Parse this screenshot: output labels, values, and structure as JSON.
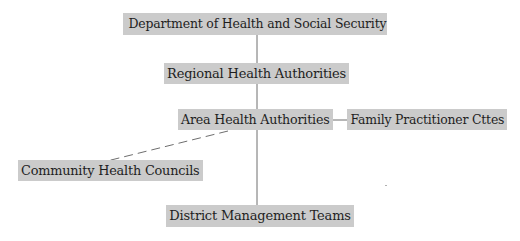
{
  "diagram": {
    "type": "org-chart",
    "colors": {
      "node_fill": "#cbcbcb",
      "text": "#1e1e1e",
      "line": "#6e6e6e",
      "background": "#ffffff"
    },
    "nodes": [
      {
        "id": "dhss",
        "label": "Department of Health and Social Security"
      },
      {
        "id": "rha",
        "label": "Regional Health Authorities"
      },
      {
        "id": "aha",
        "label": "Area Health Authorities"
      },
      {
        "id": "fpc",
        "label": "Family Practitioner Cttes"
      },
      {
        "id": "chc",
        "label": "Community Health Councils"
      },
      {
        "id": "dmt",
        "label": "District Management Teams"
      }
    ],
    "edges": [
      {
        "from": "dhss",
        "to": "rha",
        "style": "solid"
      },
      {
        "from": "rha",
        "to": "aha",
        "style": "solid"
      },
      {
        "from": "aha",
        "to": "fpc",
        "style": "solid"
      },
      {
        "from": "aha",
        "to": "dmt",
        "style": "solid"
      },
      {
        "from": "aha",
        "to": "chc",
        "style": "dashed"
      }
    ]
  }
}
